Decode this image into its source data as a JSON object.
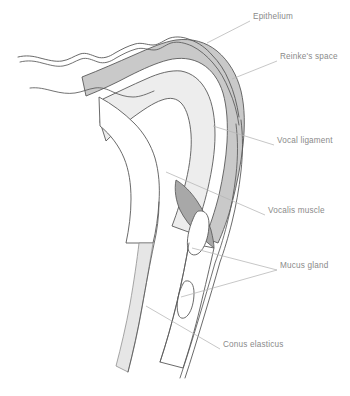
{
  "figure": {
    "background_color": "#ffffff",
    "text_color": "#8a8a8a",
    "leader_color": "#b4b4b4",
    "outline_color": "#595959"
  },
  "palette": {
    "epithelium_fill": "#ffffff",
    "reinkes_space_fill": "#c9c9c9",
    "vocal_ligament_fill": "#ededed",
    "vocalis_muscle_fill": "#a8a8a8",
    "mucus_gland_fill": "#ffffff",
    "conus_elasticus_fill": "#e6e6e6"
  },
  "labels": [
    {
      "id": "epithelium",
      "text": "Epithelium",
      "x": 253,
      "y": 17,
      "leader": true
    },
    {
      "id": "reinkes-space",
      "text": "Reinke's space",
      "x": 280,
      "y": 57,
      "leader": true
    },
    {
      "id": "vocal-ligament",
      "text": "Vocal ligament",
      "x": 277,
      "y": 141,
      "leader": true
    },
    {
      "id": "vocalis-muscle",
      "text": "Vocalis muscle",
      "x": 268,
      "y": 211,
      "leader": true
    },
    {
      "id": "mucus-gland",
      "text": "Mucus gland",
      "x": 280,
      "y": 266,
      "leader": true
    },
    {
      "id": "conus-elasticus",
      "text": "Conus elasticus",
      "x": 223,
      "y": 345,
      "leader": true
    }
  ],
  "structures": [
    {
      "id": "epithelium",
      "name": "Epithelium",
      "description": "Thin outer wavy double-line covering"
    },
    {
      "id": "reinkes-space",
      "name": "Reinke's space",
      "description": "Mid-gray superficial lamina propria band"
    },
    {
      "id": "vocal-ligament",
      "name": "Vocal ligament",
      "description": "Light inner core of the fold"
    },
    {
      "id": "vocalis-muscle",
      "name": "Vocalis muscle",
      "description": "Darker tapering wedge below the ligament"
    },
    {
      "id": "mucus-gland",
      "name": "Mucus gland",
      "description": "Two elongated oval glands in the lower wall"
    },
    {
      "id": "conus-elasticus",
      "name": "Conus elasticus",
      "description": "Light band descending to the subglottis"
    }
  ]
}
